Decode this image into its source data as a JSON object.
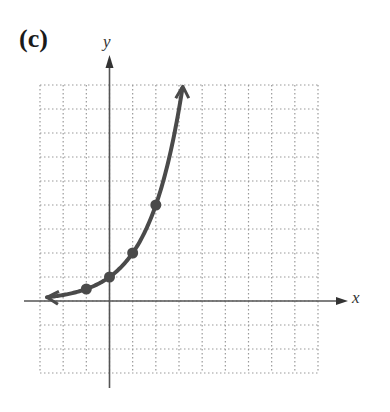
{
  "panel_label": "(c)",
  "chart_data": {
    "type": "line",
    "title": "",
    "xlabel": "x",
    "ylabel": "y",
    "xlim": [
      -3,
      9
    ],
    "ylim": [
      -3,
      9
    ],
    "grid": true,
    "grid_style": "dotted",
    "curve": "exponential, y = 2^x",
    "points": [
      {
        "x": -1,
        "y": 0.5
      },
      {
        "x": 0,
        "y": 1
      },
      {
        "x": 1,
        "y": 2
      },
      {
        "x": 2,
        "y": 4
      }
    ],
    "curve_ends": {
      "left": "arrow toward x=-3 approaching y=0",
      "right": "arrow upward near x=3, y=9"
    },
    "colors": {
      "curve": "#4a4a4a",
      "axes": "#555555",
      "grid": "#9a9a9a"
    }
  }
}
